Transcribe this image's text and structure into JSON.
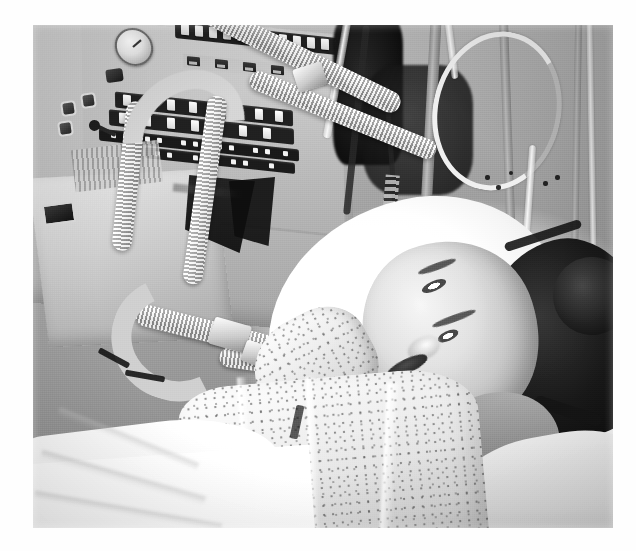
{
  "page": {
    "background_color": "#ffffff",
    "type": "scanned-photograph",
    "caption": ""
  },
  "photograph": {
    "title": "Patient in intensive care on mechanical ventilation",
    "medium": "black-and-white photograph",
    "tone": "grayscale",
    "frame": {
      "left": 33,
      "top": 25,
      "width": 580,
      "height": 503
    },
    "colors": {
      "paper": "#ffffff",
      "highlight": "#fbfbfb",
      "midtone": "#9a9a9a",
      "shadow": "#1a1a1a",
      "ink_black": "#0d0d0d"
    },
    "scene": {
      "setting": "hospital intensive care unit bedside",
      "subject": "young woman lying in bed, head turned toward camera, smiling",
      "subject_details": {
        "hair": "dark hair pulled back into a bun",
        "expression": "smiling",
        "position": "reclined on white pillow, head to the right of frame"
      }
    },
    "elements": [
      {
        "name": "ventilator-console",
        "label": "Ventilator control console",
        "position": "upper left"
      },
      {
        "name": "pressure-gauge",
        "label": "Round analog pressure gauge",
        "position": "top left"
      },
      {
        "name": "control-knob",
        "label": "Dark rotary control knob",
        "position": "below gauge"
      },
      {
        "name": "button-row-upper",
        "label": "Row of illuminated push buttons",
        "position": "top center-left"
      },
      {
        "name": "button-row-lower",
        "label": "Second bank of push buttons and indicator lamps",
        "position": "upper center-left"
      },
      {
        "name": "monitor-unit",
        "label": "Secondary monitor / humidifier unit",
        "position": "mid left"
      },
      {
        "name": "toggle-switches",
        "label": "Square toggle switches",
        "position": "mid left panel"
      },
      {
        "name": "lever-control",
        "label": "Small lever control",
        "position": "mid left panel"
      },
      {
        "name": "breathing-circuit",
        "label": "Corrugated ventilator breathing hoses",
        "position": "center"
      },
      {
        "name": "circuit-connector",
        "label": "Y-piece hose connector",
        "position": "center"
      },
      {
        "name": "iv-lines",
        "label": "IV lines and monitoring cables",
        "position": "upper right"
      },
      {
        "name": "pole-rail",
        "label": "Vertical equipment pole",
        "position": "right"
      },
      {
        "name": "hospital-gown",
        "label": "Speckled pattern hospital gown",
        "position": "lower center"
      },
      {
        "name": "bed-sheet",
        "label": "White bed sheet and folds",
        "position": "lower left"
      },
      {
        "name": "pillow",
        "label": "White pillow",
        "position": "center right"
      }
    ]
  }
}
